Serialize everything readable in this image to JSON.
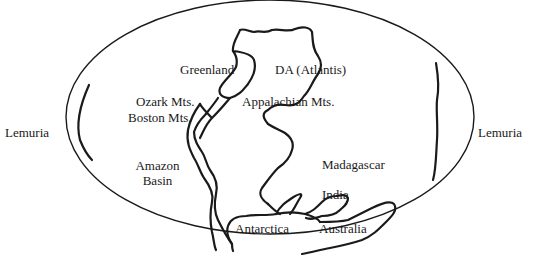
{
  "figure": {
    "type": "paleogeographic-map",
    "projection": "elliptical world outline",
    "colors": {
      "background": "#ffffff",
      "line": "#1a1a1a",
      "text": "#1a1a1a"
    }
  },
  "labels": {
    "lemuria_left": "Lemuria",
    "lemuria_right": "Lemuria",
    "greenland": "Greenland",
    "da_atlantis": "DA (Atlantis)",
    "ozark": "Ozark Mts.",
    "boston": "Boston Mts.",
    "appalachian": "Appalachian Mts.",
    "amazon_line1": "Amazon",
    "amazon_line2": "Basin",
    "madagascar": "Madagascar",
    "india": "India",
    "antarctica": "Antarctica",
    "australia": "Australia"
  }
}
